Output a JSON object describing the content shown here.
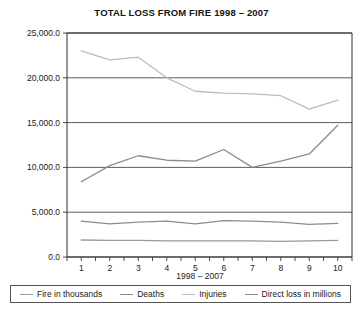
{
  "chart_data": {
    "type": "line",
    "title": "TOTAL LOSS FROM FIRE 1998 – 2007",
    "xlabel": "1998 – 2007",
    "ylabel": "",
    "categories": [
      "1",
      "2",
      "3",
      "4",
      "5",
      "6",
      "7",
      "8",
      "9",
      "10"
    ],
    "ylim": [
      0.0,
      25000.0
    ],
    "yticks": [
      "0.0",
      "5,000.0",
      "10,000.0",
      "15,000.0",
      "20,000.0",
      "25,000.0"
    ],
    "ytick_values": [
      0,
      5000,
      10000,
      15000,
      20000,
      25000
    ],
    "grid": true,
    "legend_position": "bottom",
    "series": [
      {
        "name": "Fire in thousands",
        "color": "#9a9a9a",
        "values": [
          1900,
          1850,
          1850,
          1800,
          1800,
          1800,
          1800,
          1750,
          1800,
          1850
        ]
      },
      {
        "name": "Deaths",
        "color": "#8d8d8d",
        "values": [
          4000,
          3700,
          3900,
          4000,
          3700,
          4050,
          4000,
          3900,
          3650,
          3750
        ]
      },
      {
        "name": "Injuries",
        "color": "#bcbcbc",
        "values": [
          23000,
          22000,
          22300,
          20000,
          18500,
          18300,
          18200,
          18000,
          16500,
          17500
        ]
      },
      {
        "name": "Direct loss in millions",
        "color": "#8a8a8a",
        "values": [
          8400,
          10200,
          11300,
          10800,
          10700,
          12000,
          10000,
          10700,
          11500,
          14700
        ]
      }
    ]
  }
}
